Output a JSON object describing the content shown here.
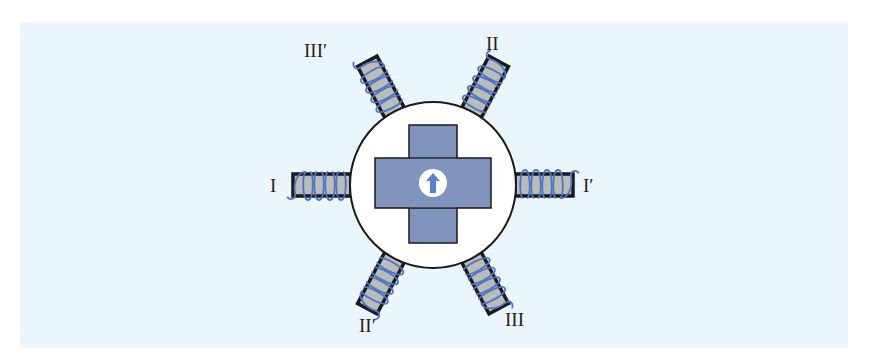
{
  "diagram": {
    "type": "stepper-motor-schematic",
    "colors": {
      "background": "#eaf6fb",
      "stator_circle": "#ffffff",
      "rotor": "#7f93bd",
      "pole_core": "#b9bcbb",
      "coil": "#4f74c4",
      "outline": "#1a1a1a",
      "arrow": "#5d80cc"
    },
    "poles": [
      {
        "id": "I",
        "label": "I",
        "angle": 180
      },
      {
        "id": "I-prime",
        "label": "I′",
        "angle": 0
      },
      {
        "id": "II",
        "label": "II",
        "angle": 60
      },
      {
        "id": "II-prime",
        "label": "II′",
        "angle": 240
      },
      {
        "id": "III",
        "label": "III",
        "angle": 300
      },
      {
        "id": "III-prime",
        "label": "III′",
        "angle": 120
      }
    ],
    "rotor": {
      "shape": "cross",
      "direction_arrow": "up-arrow"
    }
  }
}
